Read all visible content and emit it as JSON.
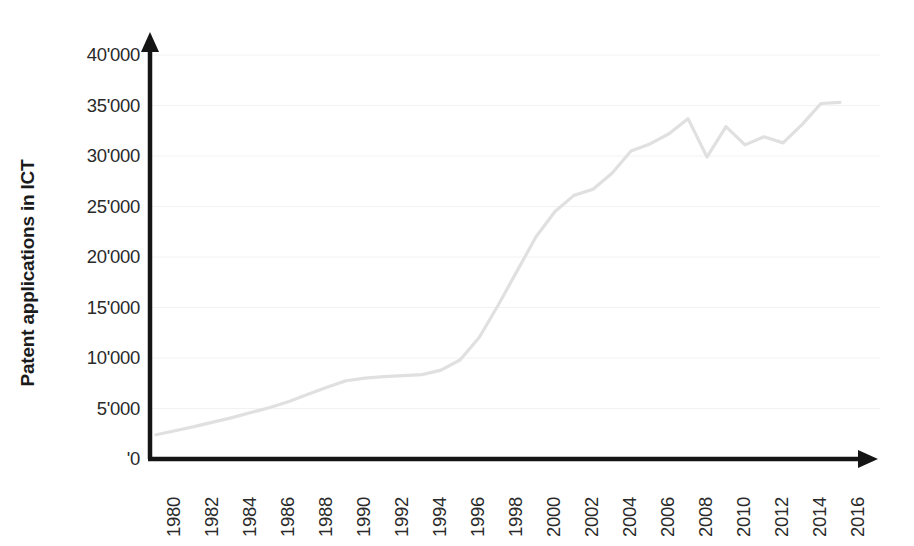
{
  "chart_data": {
    "type": "line",
    "title": "",
    "xlabel": "",
    "ylabel": "Patent applications in ICT",
    "xlim": [
      1980,
      2016
    ],
    "ylim": [
      0,
      40000
    ],
    "grid": true,
    "legend": null,
    "y_tick_labels": [
      "40'000",
      "35'000",
      "30'000",
      "25'000",
      "20'000",
      "15'000",
      "10'000",
      "5'000",
      "'0"
    ],
    "y_tick_values": [
      40000,
      35000,
      30000,
      25000,
      20000,
      15000,
      10000,
      5000,
      0
    ],
    "x_tick_labels": [
      "1980",
      "1982",
      "1984",
      "1986",
      "1988",
      "1990",
      "1992",
      "1994",
      "1996",
      "1998",
      "2000",
      "2002",
      "2004",
      "2006",
      "2008",
      "2010",
      "2012",
      "2014",
      "2016"
    ],
    "x_tick_values": [
      1980,
      1982,
      1984,
      1986,
      1988,
      1990,
      1992,
      1994,
      1996,
      1998,
      2000,
      2002,
      2004,
      2006,
      2008,
      2010,
      2012,
      2014,
      2016
    ],
    "x": [
      1980,
      1981,
      1982,
      1983,
      1984,
      1985,
      1986,
      1987,
      1988,
      1989,
      1990,
      1991,
      1992,
      1993,
      1994,
      1995,
      1996,
      1997,
      1998,
      1999,
      2000,
      2001,
      2002,
      2003,
      2004,
      2005,
      2006,
      2007,
      2008,
      2009,
      2010,
      2011,
      2012,
      2013,
      2014,
      2015,
      2016
    ],
    "values": [
      2400,
      2800,
      3200,
      3650,
      4100,
      4600,
      5100,
      5700,
      6400,
      7100,
      7750,
      8000,
      8150,
      8250,
      8350,
      8800,
      9800,
      12000,
      15200,
      18600,
      22000,
      24500,
      26100,
      26700,
      28300,
      30500,
      31200,
      32200,
      33700,
      29900,
      32900,
      31100,
      31900,
      31300,
      33100,
      35200,
      35300
    ],
    "series_name": "Patent applications in ICT",
    "line_color": "#e0e0e0",
    "axis_color": "#151515",
    "grid_color": "#f2f2f2",
    "background": "#ffffff"
  },
  "axes": {
    "y_title": "Patent applications in ICT",
    "y_arrow": "up-arrow",
    "x_arrow": "right-arrow"
  }
}
